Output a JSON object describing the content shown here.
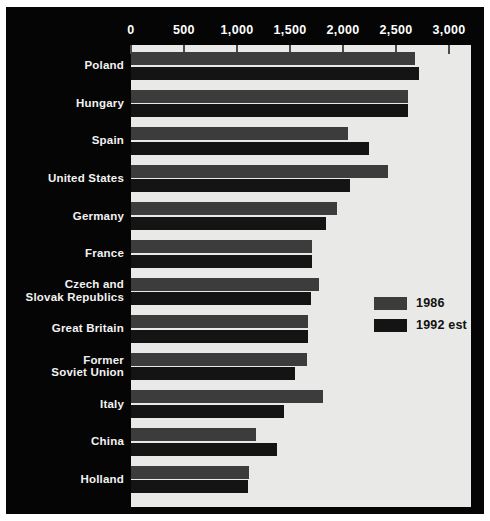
{
  "chart_data": {
    "type": "bar",
    "orientation": "horizontal",
    "title": "",
    "xlabel": "",
    "ylabel": "",
    "xlim": [
      0,
      3000
    ],
    "xticks": [
      0,
      500,
      1000,
      1500,
      2000,
      2500,
      3000
    ],
    "xtick_labels": [
      "0",
      "500",
      "1,000",
      "1,500",
      "2,000",
      "2,500",
      "3,000"
    ],
    "grid": false,
    "legend_position": "center-right",
    "categories": [
      "Poland",
      "Hungary",
      "Spain",
      "United States",
      "Germany",
      "France",
      "Czech and\nSlovak Republics",
      "Great Britain",
      "Former\nSoviet Union",
      "Italy",
      "China",
      "Holland"
    ],
    "series": [
      {
        "name": "1986",
        "color": "#3c3c3c",
        "values": [
          2680,
          2610,
          2050,
          2425,
          1945,
          1710,
          1775,
          1670,
          1660,
          1810,
          1180,
          1115
        ]
      },
      {
        "name": "1992 est",
        "color": "#141414",
        "values": [
          2715,
          2610,
          2245,
          2065,
          1840,
          1710,
          1700,
          1670,
          1545,
          1445,
          1375,
          1105
        ]
      }
    ]
  },
  "legend": {
    "items": [
      {
        "label": "1986",
        "swatch": "#3c3c3c"
      },
      {
        "label": "1992 est",
        "swatch": "#141414"
      }
    ]
  },
  "colors": {
    "panel_background": "#050505",
    "plot_background": "#e9e9e7",
    "page_background": "#ffffff",
    "series_1986": "#3c3c3c",
    "series_1992": "#141414",
    "axis_text": "#ffffff",
    "label_text": "#f2f2f2"
  }
}
